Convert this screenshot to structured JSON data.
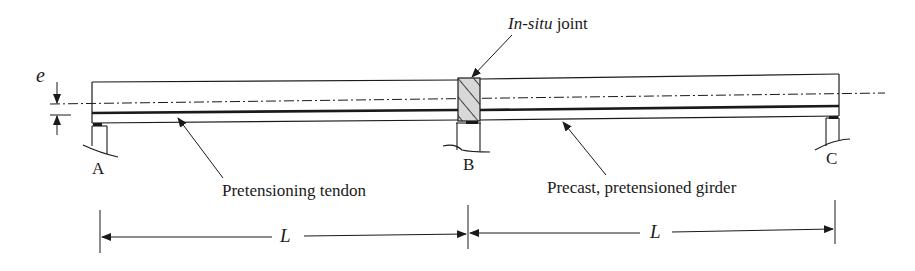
{
  "figure": {
    "type": "structural-diagram"
  },
  "labels": {
    "eccentricity": "e",
    "joint_italic": "In-situ",
    "joint_suffix": " joint",
    "support_a": "A",
    "support_b": "B",
    "support_c": "C",
    "tendon": "Pretensioning tendon",
    "girder": "Precast, pretensioned girder",
    "span_1": "L",
    "span_2": "L"
  },
  "colors": {
    "line": "#1a1a1a",
    "hatch_fill": "#d8d8d8",
    "background": "#ffffff"
  }
}
